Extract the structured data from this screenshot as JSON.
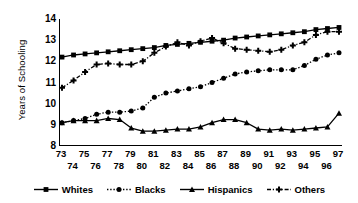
{
  "chart_data": {
    "type": "line",
    "title": "",
    "xlabel": "",
    "ylabel": "Years of Schooling",
    "ylim": [
      8,
      14
    ],
    "yticks": [
      8,
      9,
      10,
      11,
      12,
      13,
      14
    ],
    "grid": false,
    "legend_position": "bottom",
    "x": [
      73,
      74,
      75,
      76,
      77,
      78,
      79,
      80,
      81,
      82,
      83,
      84,
      85,
      86,
      87,
      88,
      89,
      90,
      91,
      92,
      93,
      94,
      95,
      96,
      97
    ],
    "xticks_top": [
      73,
      75,
      77,
      79,
      81,
      83,
      85,
      87,
      89,
      91,
      93,
      95,
      97
    ],
    "xticks_bottom": [
      74,
      76,
      78,
      80,
      82,
      84,
      86,
      88,
      90,
      92,
      94,
      96
    ],
    "series": [
      {
        "name": "Whites",
        "marker": "square",
        "line": "solid",
        "color": "#000000",
        "values": [
          12.2,
          12.3,
          12.35,
          12.4,
          12.45,
          12.5,
          12.55,
          12.6,
          12.65,
          12.75,
          12.8,
          12.85,
          12.9,
          12.95,
          13.0,
          13.1,
          13.15,
          13.2,
          13.25,
          13.3,
          13.35,
          13.4,
          13.5,
          13.55,
          13.6
        ]
      },
      {
        "name": "Blacks",
        "marker": "circle",
        "line": "dotted",
        "color": "#000000",
        "values": [
          9.1,
          9.2,
          9.3,
          9.5,
          9.6,
          9.6,
          9.65,
          9.8,
          10.3,
          10.5,
          10.6,
          10.7,
          10.8,
          11.0,
          11.2,
          11.4,
          11.5,
          11.55,
          11.6,
          11.6,
          11.6,
          11.8,
          12.1,
          12.3,
          12.4
        ]
      },
      {
        "name": "Hispanics",
        "marker": "triangle",
        "line": "solid",
        "color": "#000000",
        "values": [
          9.1,
          9.2,
          9.2,
          9.2,
          9.3,
          9.25,
          8.85,
          8.7,
          8.7,
          8.75,
          8.8,
          8.8,
          8.9,
          9.1,
          9.25,
          9.25,
          9.1,
          8.8,
          8.75,
          8.8,
          8.75,
          8.8,
          8.85,
          8.9,
          9.55
        ]
      },
      {
        "name": "Others",
        "marker": "plus",
        "line": "dash-dot",
        "color": "#000000",
        "values": [
          10.75,
          11.1,
          11.5,
          11.85,
          11.9,
          11.85,
          11.85,
          12.0,
          12.4,
          12.7,
          12.9,
          12.75,
          12.95,
          13.1,
          12.85,
          12.6,
          12.55,
          12.5,
          12.45,
          12.55,
          12.75,
          12.9,
          13.25,
          13.4,
          13.4
        ]
      }
    ]
  },
  "axis": {
    "y_title": "Years of Schooling"
  },
  "legend": {
    "items": [
      {
        "label": "Whites"
      },
      {
        "label": "Blacks"
      },
      {
        "label": "Hispanics"
      },
      {
        "label": "Others"
      }
    ]
  }
}
